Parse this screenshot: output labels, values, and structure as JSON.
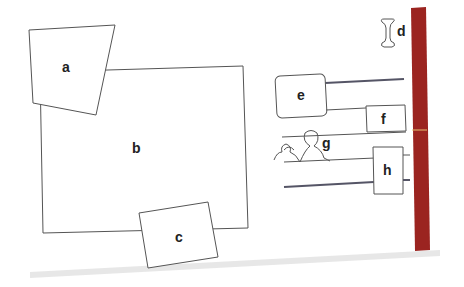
{
  "figure": {
    "labels": {
      "a": "a",
      "b": "b",
      "c": "c",
      "d": "d",
      "e": "e",
      "f": "f",
      "g": "g",
      "h": "h"
    },
    "spine_color": "#9b2420",
    "spine_text": "1944"
  }
}
